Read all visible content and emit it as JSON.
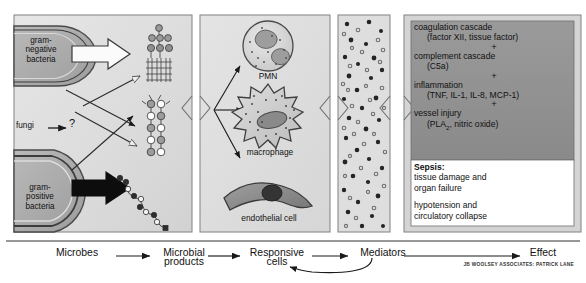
{
  "figure": {
    "credit": "JB WOOLSEY ASSOCIATES: PATRICK LANE"
  },
  "panels": {
    "microbes": {
      "name": "Microbes panel",
      "gram_negative": "gram-\nnegative\nbacteria",
      "gram_negative_lines": [
        "gram-",
        "negative",
        "bacteria"
      ],
      "fungi": "fungi",
      "question_mark": "?",
      "gram_positive_lines": [
        "gram-",
        "positive",
        "bacteria"
      ]
    },
    "microbial_products": {
      "name": "Microbial products panel",
      "labels": []
    },
    "responsive_cells": {
      "name": "Responsive cells panel",
      "cells": [
        "PMN",
        "macrophage",
        "endothelial cell"
      ]
    },
    "mediators": {
      "name": "Mediators panel",
      "labels": []
    },
    "effect": {
      "name": "Effect panel",
      "cascade": [
        {
          "head": "coagulation cascade",
          "detail": "(factor XII, tissue factor)"
        },
        {
          "head": "complement cascade",
          "detail": "(C5a)"
        },
        {
          "head": "inflammation",
          "detail": "(TNF, IL-1, IL-8, MCP-1)"
        },
        {
          "head": "vessel injury",
          "detail_pre": "(PLA",
          "detail_sub": "2",
          "detail_post": ", nitric oxide)"
        }
      ],
      "plus": "+",
      "outcome": {
        "heading": "Sepsis:",
        "line1": "tissue damage and",
        "line2": "organ failure",
        "line3": "hypotension and",
        "line4": "circulatory collapse"
      }
    }
  },
  "flow_axis": {
    "name": "Flow axis",
    "steps": [
      {
        "label_line1": "Microbes",
        "label_line2": ""
      },
      {
        "label_line1": "Microbial",
        "label_line2": "products"
      },
      {
        "label_line1": "Responsive",
        "label_line2": "cells"
      },
      {
        "label_line1": "Mediators",
        "label_line2": ""
      },
      {
        "label_line1": "Effect",
        "label_line2": ""
      }
    ],
    "feedback_arrow": "Mediators feed back to Responsive cells"
  },
  "colors": {
    "panel_fill": "#d9d9d9",
    "panel_fill_light": "#e2e2e2",
    "panel_border": "#7a7a7a",
    "cascade_fill": "#8e8e8e",
    "outcome_fill": "#ffffff",
    "ink": "#1a1a1a",
    "dot_dark": "#2b2b2b",
    "dot_mid": "#6e6e6e"
  }
}
